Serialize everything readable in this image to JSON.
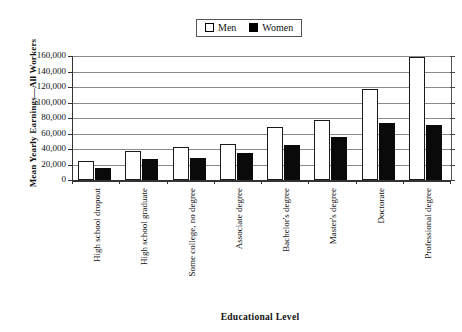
{
  "chart_data": {
    "type": "bar",
    "title": "",
    "xlabel": "Educational Level",
    "ylabel": "Mean Yearly Earnings—All Workers",
    "categories": [
      "High school dropout",
      "High school graduate",
      "Some college, no degree",
      "Associate degree",
      "Bachelor's degree",
      "Master's degree",
      "Doctorate",
      "Professional degree"
    ],
    "series": [
      {
        "name": "Men",
        "color": "#ffffff",
        "values": [
          24000,
          38000,
          42000,
          47000,
          68000,
          78000,
          117000,
          159000
        ]
      },
      {
        "name": "Women",
        "color": "#000000",
        "values": [
          15000,
          27000,
          29000,
          35000,
          45000,
          55000,
          74000,
          71000
        ]
      }
    ],
    "ylim": [
      0,
      160000
    ],
    "ytick_values": [
      0,
      20000,
      40000,
      60000,
      80000,
      100000,
      120000,
      140000,
      160000
    ],
    "ytick_labels": [
      "0",
      "20,000",
      "40,000",
      "60,000",
      "80,000",
      "100,000",
      "120,000",
      "140,000",
      "160,000"
    ],
    "grid": true,
    "legend_position": "top-center"
  },
  "legend": {
    "items": [
      {
        "label": "Men",
        "swatch": "open-square-swatch"
      },
      {
        "label": "Women",
        "swatch": "filled-square-swatch"
      }
    ]
  }
}
